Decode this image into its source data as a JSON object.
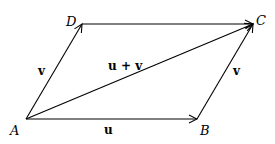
{
  "diagram": {
    "type": "vector-parallelogram",
    "points": {
      "A": {
        "label": "A",
        "x": 26,
        "y": 119
      },
      "B": {
        "label": "B",
        "x": 197,
        "y": 119
      },
      "C": {
        "label": "C",
        "x": 253,
        "y": 24
      },
      "D": {
        "label": "D",
        "x": 82,
        "y": 24
      }
    },
    "vectors": [
      {
        "from": "A",
        "to": "B",
        "label": "u"
      },
      {
        "from": "A",
        "to": "D",
        "label": "v"
      },
      {
        "from": "D",
        "to": "C",
        "label": ""
      },
      {
        "from": "B",
        "to": "C",
        "label": "v"
      },
      {
        "from": "A",
        "to": "C",
        "label": "u + v"
      }
    ],
    "labels": {
      "A": "A",
      "B": "B",
      "C": "C",
      "D": "D",
      "u": "u",
      "v_left": "v",
      "v_right": "v",
      "sum": "u + v"
    },
    "stroke_color": "#000000"
  }
}
